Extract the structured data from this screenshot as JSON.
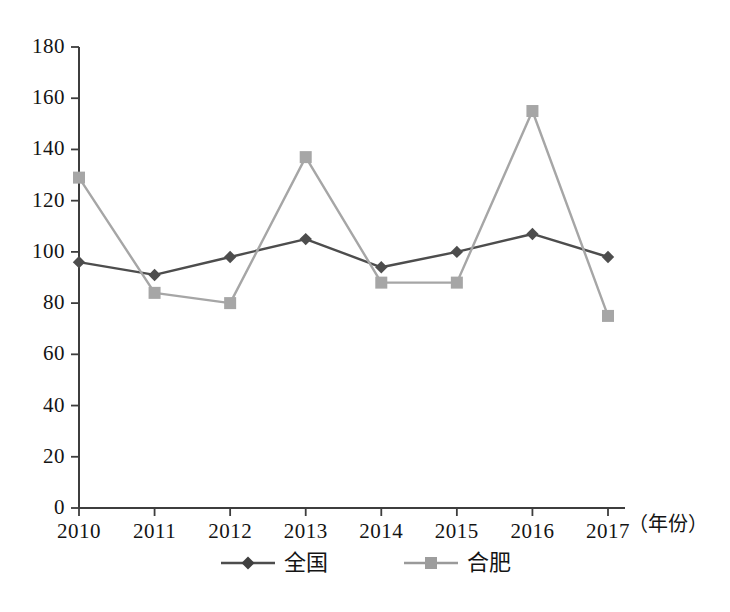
{
  "chart_data": {
    "type": "line",
    "title": "",
    "subtitle": "",
    "xlabel": "（年份）",
    "ylabel": "",
    "categories": [
      "2010",
      "2011",
      "2012",
      "2013",
      "2014",
      "2015",
      "2016",
      "2017"
    ],
    "x": [
      2010,
      2011,
      2012,
      2013,
      2014,
      2015,
      2016,
      2017
    ],
    "xlim": [
      2010,
      2017
    ],
    "ylim": [
      0,
      180
    ],
    "ytick_step": 20,
    "yticks": [
      0,
      20,
      40,
      60,
      80,
      100,
      120,
      140,
      160,
      180
    ],
    "grid": false,
    "legend_position": "bottom-center",
    "series": [
      {
        "name": "全国",
        "color": "#4d4d4d",
        "marker": "diamond",
        "values": [
          96,
          91,
          98,
          105,
          94,
          100,
          107,
          98
        ]
      },
      {
        "name": "合肥",
        "color": "#a6a6a6",
        "marker": "square",
        "values": [
          129,
          84,
          80,
          137,
          88,
          88,
          155,
          75
        ]
      }
    ]
  },
  "axes": {
    "y_tick_labels": [
      "180",
      "160",
      "140",
      "120",
      "100",
      "80",
      "60",
      "40",
      "20",
      "0"
    ],
    "x_tick_labels": [
      "2010",
      "2011",
      "2012",
      "2013",
      "2014",
      "2015",
      "2016",
      "2017"
    ],
    "x_unit_label": "（年份）"
  },
  "legend": {
    "items": [
      {
        "label": "全国",
        "color": "#4d4d4d",
        "marker": "diamond"
      },
      {
        "label": "合肥",
        "color": "#a6a6a6",
        "marker": "square"
      }
    ]
  },
  "style": {
    "axis_color": "#3d3d3d",
    "background": "#ffffff",
    "series_national_color": "#4d4d4d",
    "series_hefei_color": "#a6a6a6"
  }
}
